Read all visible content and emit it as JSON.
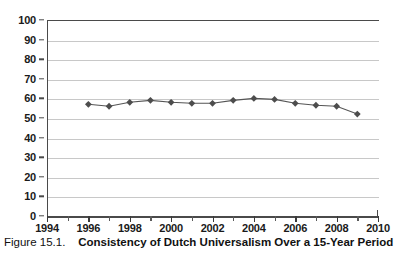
{
  "caption": {
    "number": "Figure 15.1.",
    "title": "Consistency of Dutch Universalism Over a 15-Year Period"
  },
  "chart_data": {
    "type": "line",
    "title": "Consistency of Dutch Universalism Over a 15-Year Period",
    "xlabel": "",
    "ylabel": "",
    "xlim": [
      1994,
      2010
    ],
    "ylim": [
      0,
      100
    ],
    "grid": true,
    "legend": "none",
    "marker": "diamond",
    "line_color": "#555555",
    "marker_color": "#4d4d4d",
    "x": [
      1996,
      1997,
      1998,
      1999,
      2000,
      2001,
      2002,
      2003,
      2004,
      2005,
      2006,
      2007,
      2008,
      2009
    ],
    "values": [
      57,
      56,
      58,
      59,
      58,
      57.5,
      57.5,
      59,
      60,
      59.5,
      57.5,
      56.5,
      56,
      52
    ],
    "x_ticks": [
      1994,
      1996,
      1998,
      2000,
      2002,
      2004,
      2006,
      2008,
      2010
    ],
    "x_tick_labels": [
      "1994",
      "1996",
      "1998",
      "2000",
      "2002",
      "2004",
      "2006",
      "2008",
      "2010"
    ],
    "x_minor_ticks": [
      1995,
      1997,
      1999,
      2001,
      2003,
      2005,
      2007,
      2009
    ],
    "y_ticks": [
      0,
      10,
      20,
      30,
      40,
      50,
      60,
      70,
      80,
      90,
      100
    ],
    "y_tick_labels": [
      "0",
      "10",
      "20",
      "30",
      "40",
      "50",
      "60",
      "70",
      "80",
      "90",
      "100"
    ]
  }
}
